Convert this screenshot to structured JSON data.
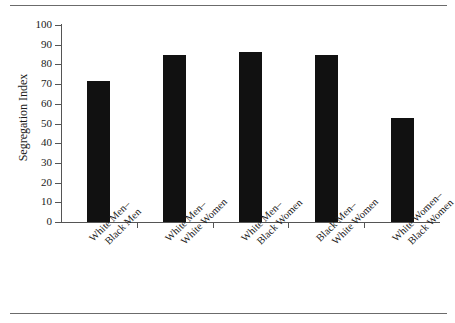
{
  "chart_data": {
    "type": "bar",
    "title": "",
    "xlabel": "",
    "ylabel": "Segregation Index",
    "ylim": [
      0,
      100
    ],
    "yticks": [
      0,
      10,
      20,
      30,
      40,
      50,
      60,
      70,
      80,
      90,
      100
    ],
    "grid": false,
    "legend": false,
    "bar_color": "#111111",
    "categories": [
      {
        "line1": "White Men–",
        "line2": "Black Men"
      },
      {
        "line1": "White Men–",
        "line2": "White Women"
      },
      {
        "line1": "White Men–",
        "line2": "Black Women"
      },
      {
        "line1": "Black Men–",
        "line2": "White Women"
      },
      {
        "line1": "White Women–",
        "line2": "Black Women"
      }
    ],
    "values": [
      71.5,
      85,
      86.5,
      85,
      53
    ]
  }
}
